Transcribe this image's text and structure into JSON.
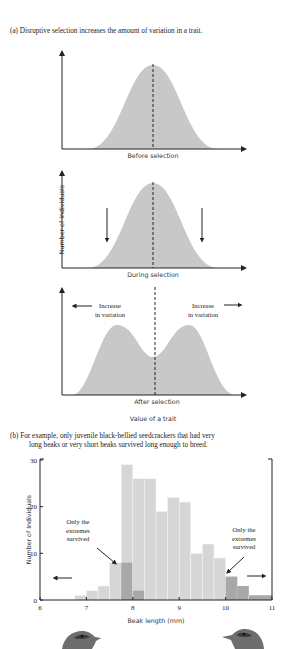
{
  "header": {
    "running_title": "GENETIC DRIFT | 165"
  },
  "panel_a": {
    "caption": "(a) Disruptive selection increases the amount of variation in a trait.",
    "graphs": [
      {
        "label": "Before selection"
      },
      {
        "label": "During selection"
      },
      {
        "label": "After selection",
        "annotation_left": [
          "Increase",
          "in variation"
        ],
        "annotation_right": [
          "Increase",
          "in variation"
        ]
      }
    ],
    "y_label": "Number of Individuals",
    "x_label": "Value of a trait"
  },
  "panel_b": {
    "caption_line1": "(b) For example, only juvenile black-bellied seedcrackers that had very",
    "caption_line2": "long beaks or very short beaks survived long enough to breed.",
    "annotation_left": [
      "Only the",
      "extremes",
      "survived"
    ],
    "annotation_right": [
      "Only the",
      "extremes",
      "survived"
    ]
  },
  "chart_data": [
    {
      "type": "area",
      "title": "Before selection",
      "xlabel": "Value of a trait",
      "ylabel": "Number of Individuals",
      "shape": "unimodal normal distribution, mean marked by dashed line"
    },
    {
      "type": "area",
      "title": "During selection",
      "xlabel": "Value of a trait",
      "ylabel": "Number of Individuals",
      "shape": "unimodal normal distribution with downward arrows on both sides marking selection against intermediate values",
      "annotations": [
        "down arrow left",
        "down arrow right"
      ]
    },
    {
      "type": "area",
      "title": "After selection",
      "xlabel": "Value of a trait",
      "ylabel": "Number of Individuals",
      "shape": "bimodal distribution with dip at mean",
      "annotations": [
        "Increase in variation (left arrow)",
        "Increase in variation (right arrow)"
      ]
    },
    {
      "type": "bar",
      "title": "",
      "xlabel": "Beak length (mm)",
      "ylabel": "Number of Individuals",
      "xlim": [
        6,
        11
      ],
      "ylim": [
        0,
        30
      ],
      "x_ticks": [
        "6",
        "7",
        "8",
        "9",
        "10",
        "11"
      ],
      "y_ticks": [
        "0",
        "10",
        "20",
        "30"
      ],
      "bin_width": 0.25,
      "bins": [
        {
          "start": 6.75,
          "end": 7.0,
          "total": 1,
          "survived": 0
        },
        {
          "start": 7.0,
          "end": 7.25,
          "total": 2,
          "survived": 0
        },
        {
          "start": 7.25,
          "end": 7.5,
          "total": 3,
          "survived": 0
        },
        {
          "start": 7.5,
          "end": 7.75,
          "total": 8,
          "survived": 0
        },
        {
          "start": 7.75,
          "end": 8.0,
          "total": 29,
          "survived": 8
        },
        {
          "start": 8.0,
          "end": 8.25,
          "total": 26,
          "survived": 2
        },
        {
          "start": 8.25,
          "end": 8.5,
          "total": 26,
          "survived": 0
        },
        {
          "start": 8.5,
          "end": 8.75,
          "total": 19,
          "survived": 0
        },
        {
          "start": 8.75,
          "end": 9.0,
          "total": 22,
          "survived": 0
        },
        {
          "start": 9.0,
          "end": 9.25,
          "total": 21,
          "survived": 0
        },
        {
          "start": 9.25,
          "end": 9.5,
          "total": 10,
          "survived": 0
        },
        {
          "start": 9.5,
          "end": 9.75,
          "total": 12,
          "survived": 0
        },
        {
          "start": 9.75,
          "end": 10.0,
          "total": 9,
          "survived": 0
        },
        {
          "start": 10.0,
          "end": 10.25,
          "total": 5,
          "survived": 5
        },
        {
          "start": 10.25,
          "end": 10.5,
          "total": 3,
          "survived": 3
        },
        {
          "start": 10.5,
          "end": 11.0,
          "total": 1,
          "survived": 1
        }
      ],
      "series": [
        {
          "name": "All juveniles",
          "color": "#d4d4d4"
        },
        {
          "name": "Survived (extremes)",
          "color": "#a9a9a9"
        }
      ],
      "annotations": [
        "Only the extremes survived (left, arrow to ~7.9)",
        "Only the extremes survived (right, arrow to ~10.0)",
        "left arrow near 6.5",
        "right arrow near 10.8"
      ],
      "grid": false
    }
  ],
  "colors": {
    "curve_fill": "#c8c8c8",
    "bar_fill": "#d6d6d6",
    "bar_dark": "#a8a8a8",
    "axis": "#222222"
  }
}
